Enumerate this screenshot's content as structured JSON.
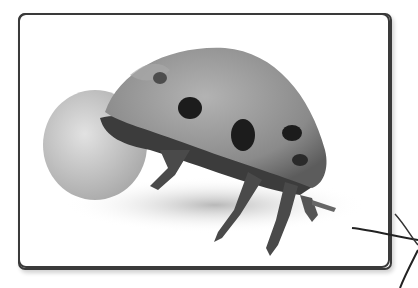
{
  "image": {
    "subject": "ladybug with egg",
    "palette": {
      "frame_stroke": "#3a3a3a",
      "background": "#ffffff",
      "shell": "#8f8f8f",
      "spots": "#1c1c1c",
      "egg": "#c9c9c9",
      "legs": "#4a4a4a"
    }
  }
}
